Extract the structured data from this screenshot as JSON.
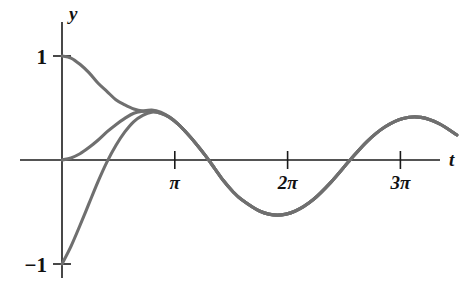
{
  "figure": {
    "background": "#ffffff",
    "curve_color": "#6f6f6f",
    "axis_color": "#1a1a1a"
  },
  "axes": {
    "y_label": "y",
    "t_label": "t",
    "y_ticks": [
      {
        "label": "1",
        "value": 1
      },
      {
        "label": "−1",
        "value": -1
      }
    ],
    "x_ticks": [
      {
        "label": "π",
        "value": 3.14159
      },
      {
        "label": "2π",
        "value": 6.28319
      },
      {
        "label": "3π",
        "value": 9.42478
      }
    ]
  },
  "chart_data": {
    "type": "line",
    "title": "",
    "xlabel": "t",
    "ylabel": "y",
    "xlim": [
      -0.15,
      11.1
    ],
    "ylim": [
      -1.12,
      1.12
    ],
    "grid": false,
    "legend": null,
    "x_tick_values": [
      3.14159,
      6.28319,
      9.42478
    ],
    "x_tick_labels": [
      "π",
      "2π",
      "3π"
    ],
    "y_tick_values": [
      1,
      -1
    ],
    "y_tick_labels": [
      "1",
      "−1"
    ],
    "series": [
      {
        "name": "y(0) = 1",
        "initial_value": 1,
        "x": [
          0.0,
          0.25,
          0.5,
          0.75,
          1.0,
          1.25,
          1.5,
          1.75,
          2.0,
          2.25,
          2.5,
          2.75,
          3.0,
          3.25,
          3.5,
          3.75,
          4.0,
          4.25,
          4.5,
          4.75,
          5.0,
          5.5,
          6.0,
          6.5,
          7.0,
          7.5,
          8.0,
          8.5,
          9.0,
          9.5,
          10.0,
          10.5,
          11.0
        ],
        "y": [
          1.0,
          0.98,
          0.92,
          0.84,
          0.74,
          0.66,
          0.58,
          0.53,
          0.49,
          0.47,
          0.47,
          0.45,
          0.41,
          0.34,
          0.25,
          0.15,
          0.04,
          -0.08,
          -0.2,
          -0.3,
          -0.38,
          -0.49,
          -0.53,
          -0.49,
          -0.38,
          -0.21,
          -0.01,
          0.18,
          0.32,
          0.4,
          0.41,
          0.35,
          0.24
        ]
      },
      {
        "name": "y(0) = 0",
        "initial_value": 0,
        "x": [
          0.0,
          0.25,
          0.5,
          0.75,
          1.0,
          1.25,
          1.5,
          1.75,
          2.0,
          2.25,
          2.5,
          2.75,
          3.0,
          3.25,
          3.5,
          3.75,
          4.0,
          4.25,
          4.5,
          4.75,
          5.0,
          5.5,
          6.0,
          6.5,
          7.0,
          7.5,
          8.0,
          8.5,
          9.0,
          9.5,
          10.0,
          10.5,
          11.0
        ],
        "y": [
          0.0,
          0.02,
          0.06,
          0.12,
          0.19,
          0.27,
          0.34,
          0.4,
          0.45,
          0.47,
          0.48,
          0.46,
          0.41,
          0.34,
          0.25,
          0.15,
          0.04,
          -0.08,
          -0.2,
          -0.3,
          -0.38,
          -0.49,
          -0.53,
          -0.49,
          -0.38,
          -0.21,
          -0.01,
          0.18,
          0.32,
          0.4,
          0.41,
          0.35,
          0.24
        ]
      },
      {
        "name": "y(0) = -1",
        "initial_value": -1,
        "x": [
          0.0,
          0.25,
          0.5,
          0.75,
          1.0,
          1.25,
          1.5,
          1.75,
          2.0,
          2.25,
          2.5,
          2.75,
          3.0,
          3.25,
          3.5,
          3.75,
          4.0,
          4.25,
          4.5,
          4.75,
          5.0,
          5.5,
          6.0,
          6.5,
          7.0,
          7.5,
          8.0,
          8.5,
          9.0,
          9.5,
          10.0,
          10.5,
          11.0
        ],
        "y": [
          -1.0,
          -0.83,
          -0.63,
          -0.42,
          -0.21,
          -0.02,
          0.14,
          0.27,
          0.37,
          0.43,
          0.46,
          0.45,
          0.41,
          0.34,
          0.25,
          0.15,
          0.04,
          -0.08,
          -0.2,
          -0.3,
          -0.38,
          -0.49,
          -0.53,
          -0.49,
          -0.38,
          -0.21,
          -0.01,
          0.18,
          0.32,
          0.4,
          0.41,
          0.35,
          0.24
        ]
      }
    ]
  }
}
